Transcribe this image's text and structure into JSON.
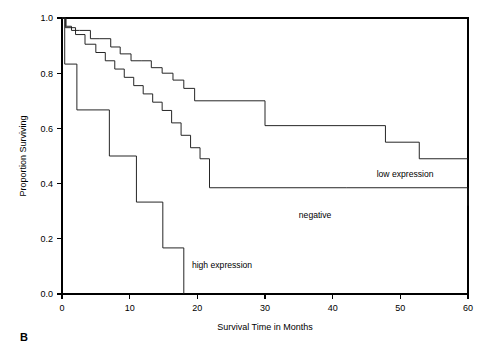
{
  "figure": {
    "panel_label": "B",
    "background_color": "#ffffff",
    "line_color": "#1a1a1a"
  },
  "chart_data": {
    "type": "line",
    "subtype": "kaplan-meier-step",
    "title": "",
    "xlabel": "Survival Time in Months",
    "ylabel": "Proportion Surviving",
    "xlim": [
      0,
      60
    ],
    "ylim": [
      0.0,
      1.0
    ],
    "xticks": [
      0,
      10,
      20,
      30,
      40,
      50,
      60
    ],
    "xtick_labels": [
      "0",
      "10",
      "20",
      "30",
      "40",
      "50",
      "60"
    ],
    "yticks": [
      0.0,
      0.2,
      0.4,
      0.6,
      0.8,
      1.0
    ],
    "ytick_labels": [
      "0.0",
      "0.2",
      "0.4",
      "0.6",
      "0.8",
      "1.0"
    ],
    "grid": false,
    "legend": "inline-annotations",
    "series": [
      {
        "name": "low expression",
        "label": "low expression",
        "label_x": 46.5,
        "label_y": 0.425,
        "x": [
          0,
          0.6,
          1.4,
          2.6,
          4.2,
          5.6,
          7.2,
          8.6,
          10.2,
          11.8,
          13.2,
          14.8,
          16.4,
          18.0,
          19.6,
          30.0,
          47.8,
          52.8,
          60.0
        ],
        "y": [
          1.0,
          0.97,
          0.955,
          0.955,
          0.925,
          0.925,
          0.895,
          0.87,
          0.845,
          0.845,
          0.82,
          0.8,
          0.775,
          0.745,
          0.7,
          0.61,
          0.55,
          0.49,
          0.49
        ]
      },
      {
        "name": "negative",
        "label": "negative",
        "label_x": 35.0,
        "label_y": 0.275,
        "x": [
          0,
          0.5,
          2.0,
          3.4,
          5.0,
          6.4,
          7.8,
          9.2,
          10.6,
          12.0,
          13.4,
          14.8,
          16.2,
          17.6,
          19.0,
          20.4,
          21.8,
          42.0,
          60.0
        ],
        "y": [
          1.0,
          0.965,
          0.94,
          0.905,
          0.875,
          0.845,
          0.815,
          0.785,
          0.755,
          0.725,
          0.695,
          0.665,
          0.62,
          0.575,
          0.53,
          0.49,
          0.385,
          0.385,
          0.32
        ]
      },
      {
        "name": "high expression",
        "label": "high expression",
        "label_x": 19.2,
        "label_y": 0.095,
        "x": [
          0,
          0.4,
          2.2,
          7.0,
          11.0,
          14.9,
          18.0
        ],
        "y": [
          1.0,
          0.833,
          0.667,
          0.5,
          0.333,
          0.167,
          0.0
        ]
      }
    ]
  }
}
